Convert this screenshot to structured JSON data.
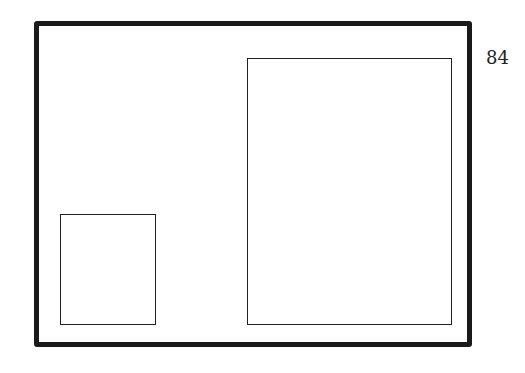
{
  "page": {
    "page_number": "84",
    "background_color": "#ffffff",
    "line_color": "#1a1a1a"
  },
  "figure": {
    "outer_frame": {
      "label": ""
    },
    "boxes": [
      {
        "id": "small-box",
        "label": ""
      },
      {
        "id": "large-box",
        "label": ""
      }
    ]
  }
}
